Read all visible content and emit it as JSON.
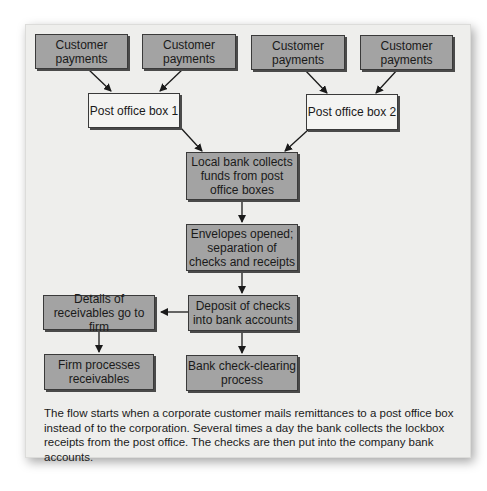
{
  "diagram": {
    "nodes": {
      "customer1": "Customer payments",
      "customer2": "Customer payments",
      "customer3": "Customer payments",
      "customer4": "Customer payments",
      "pobox1": "Post office box 1",
      "pobox2": "Post office box 2",
      "local_bank": "Local bank collects funds from post office boxes",
      "envelopes": "Envelopes opened; separation of checks and receipts",
      "deposit": "Deposit of checks into bank accounts",
      "details": "Details of receivables go to firm",
      "firm_processes": "Firm processes receivables",
      "clearing": "Bank check-clearing process"
    },
    "edges": [
      [
        "customer1",
        "pobox1"
      ],
      [
        "customer2",
        "pobox1"
      ],
      [
        "customer3",
        "pobox2"
      ],
      [
        "customer4",
        "pobox2"
      ],
      [
        "pobox1",
        "local_bank"
      ],
      [
        "pobox2",
        "local_bank"
      ],
      [
        "local_bank",
        "envelopes"
      ],
      [
        "envelopes",
        "deposit"
      ],
      [
        "deposit",
        "details"
      ],
      [
        "deposit",
        "clearing"
      ],
      [
        "details",
        "firm_processes"
      ]
    ],
    "colors": {
      "dark_box": "#a3a3a3",
      "light_box": "#f4f4f2",
      "panel": "#eeeeec"
    }
  },
  "caption": "The flow starts when a corporate customer mails remittances to a post office box instead of to the corporation. Several times a day the bank collects the lockbox receipts from the post office. The checks are then put into the company bank accounts."
}
